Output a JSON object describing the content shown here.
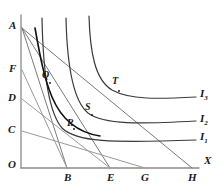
{
  "figure": {
    "type": "indifference-curve-diagram",
    "axis_label_x": "X",
    "background_color": "#ffffff",
    "line_color": "#4a4a4a",
    "bold_line_color": "#111111",
    "label_color": "#1a1a1a"
  },
  "y_axis_labels": [
    {
      "id": "A",
      "text": "A",
      "x": 9,
      "y": 20
    },
    {
      "id": "F",
      "text": "F",
      "x": 9,
      "y": 66
    },
    {
      "id": "D",
      "text": "D",
      "x": 8,
      "y": 95
    },
    {
      "id": "C",
      "text": "C",
      "x": 8,
      "y": 127
    },
    {
      "id": "O",
      "text": "O",
      "x": 8,
      "y": 162
    }
  ],
  "x_axis_labels": [
    {
      "id": "B",
      "text": "B",
      "x": 64,
      "y": 174
    },
    {
      "id": "E",
      "text": "E",
      "x": 107,
      "y": 174
    },
    {
      "id": "G",
      "text": "G",
      "x": 141,
      "y": 174
    },
    {
      "id": "H",
      "text": "H",
      "x": 188,
      "y": 174
    },
    {
      "id": "X",
      "text": "X",
      "x": 204,
      "y": 160
    }
  ],
  "point_labels": [
    {
      "id": "Q",
      "text": "Q",
      "x": 43,
      "y": 74
    },
    {
      "id": "R",
      "text": "R",
      "x": 68,
      "y": 122
    },
    {
      "id": "S",
      "text": "S",
      "x": 85,
      "y": 106
    },
    {
      "id": "T",
      "text": "T",
      "x": 113,
      "y": 79
    }
  ],
  "curve_labels": [
    {
      "id": "I3",
      "letter": "I",
      "subscript": "3",
      "x": 200,
      "y": 93
    },
    {
      "id": "I2",
      "letter": "I",
      "subscript": "2",
      "x": 200,
      "y": 118
    },
    {
      "id": "I1",
      "letter": "I",
      "subscript": "1",
      "x": 200,
      "y": 136
    }
  ],
  "geometry": {
    "origin": {
      "x": 21,
      "y": 168
    },
    "y_axis_top": {
      "x": 21,
      "y": 15
    },
    "x_axis_right": {
      "x": 199,
      "y": 168
    },
    "A": {
      "x": 21,
      "y": 27
    },
    "F": {
      "x": 21,
      "y": 70
    },
    "D": {
      "x": 21,
      "y": 99
    },
    "C": {
      "x": 21,
      "y": 131
    },
    "B": {
      "x": 67,
      "y": 168
    },
    "E": {
      "x": 110,
      "y": 168
    },
    "G": {
      "x": 145,
      "y": 168
    },
    "H": {
      "x": 192,
      "y": 168
    }
  },
  "budget_lines": [
    {
      "id": "AB",
      "from": "A",
      "to": "B"
    },
    {
      "id": "AE",
      "from": "A",
      "to": "E"
    },
    {
      "id": "AH",
      "from": "A",
      "to": "H"
    },
    {
      "id": "FB",
      "from": "F",
      "to": "B"
    },
    {
      "id": "DE",
      "from": "D",
      "to": "E"
    },
    {
      "id": "CG",
      "from": "C",
      "to": "G"
    }
  ],
  "indifference_curves": [
    {
      "id": "I1",
      "label": "I1",
      "asymptote_x": 42,
      "asymptote_y": 140
    },
    {
      "id": "I2",
      "label": "I2",
      "asymptote_x": 66,
      "asymptote_y": 121
    },
    {
      "id": "I3",
      "label": "I3",
      "asymptote_x": 89,
      "asymptote_y": 97
    }
  ],
  "price_consumption_curve": {
    "id": "PCC",
    "passes_through": [
      "Q",
      "R"
    ],
    "emphasis": "bold"
  }
}
